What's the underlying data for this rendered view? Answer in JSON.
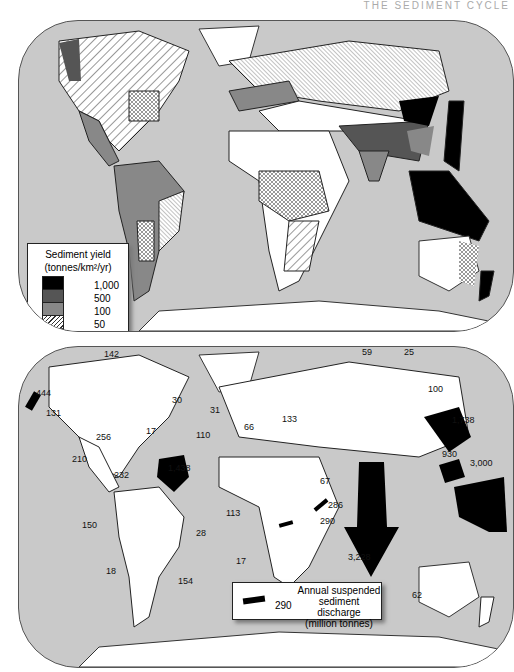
{
  "header": {
    "running_title": "THE SEDIMENT CYCLE"
  },
  "map1": {
    "legend": {
      "title_line1": "Sediment yield",
      "title_line2": "(tonnes/km²/yr)",
      "classes": [
        {
          "label": "1,000",
          "fill": "#000000",
          "pattern": "solid"
        },
        {
          "label": "500",
          "fill": "#555555",
          "pattern": "solid"
        },
        {
          "label": "100",
          "fill": "#888888",
          "pattern": "solid"
        },
        {
          "label": "50",
          "fill": "#ffffff",
          "pattern": "wide-diagonal-hatch"
        },
        {
          "label": "10",
          "fill": "#ffffff",
          "pattern": "crosshatch"
        },
        {
          "label": "",
          "fill": "#ffffff",
          "pattern": "fine-diagonal-hatch"
        }
      ]
    }
  },
  "map2": {
    "legend": {
      "line1": "Annual suspended",
      "line2": "sediment discharge",
      "line3": "(million tonnes)",
      "example_value": "290"
    },
    "discharges": [
      {
        "label": "142",
        "x": 104,
        "y": 352
      },
      {
        "label": "444",
        "x": 36,
        "y": 390
      },
      {
        "label": "131",
        "x": 46,
        "y": 410
      },
      {
        "label": "30",
        "x": 172,
        "y": 397
      },
      {
        "label": "17",
        "x": 146,
        "y": 428
      },
      {
        "label": "256",
        "x": 96,
        "y": 434
      },
      {
        "label": "210",
        "x": 72,
        "y": 456
      },
      {
        "label": "232",
        "x": 114,
        "y": 473
      },
      {
        "label": "1,438",
        "x": 168,
        "y": 466
      },
      {
        "label": "59",
        "x": 362,
        "y": 350
      },
      {
        "label": "25",
        "x": 404,
        "y": 350
      },
      {
        "label": "100",
        "x": 428,
        "y": 385
      },
      {
        "label": "31",
        "x": 210,
        "y": 408
      },
      {
        "label": "133",
        "x": 282,
        "y": 416
      },
      {
        "label": "66",
        "x": 244,
        "y": 424
      },
      {
        "label": "110",
        "x": 196,
        "y": 432
      },
      {
        "label": "1,738",
        "x": 452,
        "y": 417
      },
      {
        "label": "930",
        "x": 442,
        "y": 451
      },
      {
        "label": "3,000",
        "x": 470,
        "y": 460
      },
      {
        "label": "67",
        "x": 320,
        "y": 478
      },
      {
        "label": "286",
        "x": 328,
        "y": 502
      },
      {
        "label": "113",
        "x": 226,
        "y": 510
      },
      {
        "label": "290",
        "x": 320,
        "y": 518
      },
      {
        "label": "150",
        "x": 82,
        "y": 522
      },
      {
        "label": "28",
        "x": 196,
        "y": 530
      },
      {
        "label": "3,228",
        "x": 348,
        "y": 554
      },
      {
        "label": "17",
        "x": 236,
        "y": 558
      },
      {
        "label": "18",
        "x": 106,
        "y": 568
      },
      {
        "label": "154",
        "x": 178,
        "y": 578
      },
      {
        "label": "62",
        "x": 412,
        "y": 592
      }
    ]
  }
}
